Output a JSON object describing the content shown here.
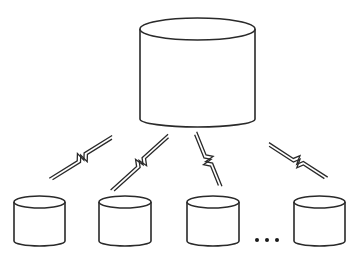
{
  "diagram": {
    "type": "distributed-database-topology",
    "stroke_color": "#2a2a2a",
    "background": "#ffffff",
    "central_node": {
      "shape": "cylinder-icon",
      "label": ""
    },
    "leaf_nodes": [
      {
        "shape": "cylinder-icon",
        "label": ""
      },
      {
        "shape": "cylinder-icon",
        "label": ""
      },
      {
        "shape": "cylinder-icon",
        "label": ""
      },
      {
        "shape": "cylinder-icon",
        "label": ""
      }
    ],
    "links": [
      {
        "from": "central",
        "to": 0,
        "style": "lightning-bolt-icon"
      },
      {
        "from": "central",
        "to": 1,
        "style": "lightning-bolt-icon"
      },
      {
        "from": "central",
        "to": 2,
        "style": "lightning-bolt-icon"
      },
      {
        "from": "central",
        "to": 3,
        "style": "lightning-bolt-icon"
      }
    ],
    "ellipsis": "..."
  }
}
